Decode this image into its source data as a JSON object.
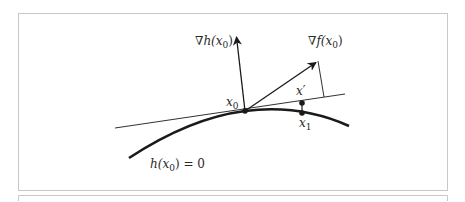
{
  "figure": {
    "frame_color": "#c8c8c8",
    "stroke_color": "#1a1a1a",
    "labels": {
      "grad_h": {
        "nabla": "∇",
        "fn": "h(x",
        "sub": "0",
        "close": ")"
      },
      "grad_f": {
        "nabla": "∇",
        "fn": "f(x",
        "sub": "0",
        "close": ")"
      },
      "x0": {
        "base": "x",
        "sub": "0"
      },
      "x_prime": {
        "base": "x",
        "prime": "′"
      },
      "x1": {
        "base": "x",
        "sub": "1"
      },
      "constraint": {
        "fn": "h(x",
        "sub": "0",
        "close": ") = 0"
      }
    },
    "points": {
      "x0": [
        245,
        111
      ],
      "x_prime": [
        302,
        103
      ],
      "x1": [
        302,
        113
      ]
    },
    "vectors": {
      "grad_h_tip": [
        236,
        35
      ],
      "grad_f_tip": [
        318,
        61
      ]
    }
  }
}
